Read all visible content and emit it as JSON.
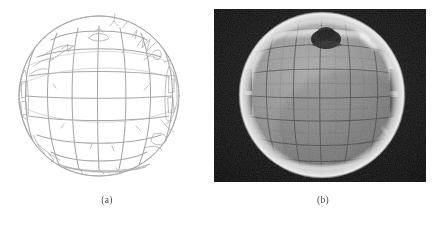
{
  "figure": {
    "panels": [
      {
        "id": "panel-a",
        "caption": "(a)",
        "kind": "line-drawing",
        "subject": "hand-drawn sketch of a mirrored sphere overlaid with a latitude/longitude calibration grid",
        "ink_color": "#9a9a9a",
        "background_color": "#ffffff"
      },
      {
        "id": "panel-b",
        "caption": "(b)",
        "kind": "photograph",
        "subject": "grayscale photograph of a mirrored sphere reflecting a gridded backdrop, room and photographer",
        "background_color": "#0a0a0a",
        "sphere_color": "#8d8d8d",
        "grid_color": "#4a4a4a",
        "highlight_color": "#e8e8e8"
      }
    ],
    "grid": {
      "meridians": 7,
      "parallels": 7
    }
  }
}
